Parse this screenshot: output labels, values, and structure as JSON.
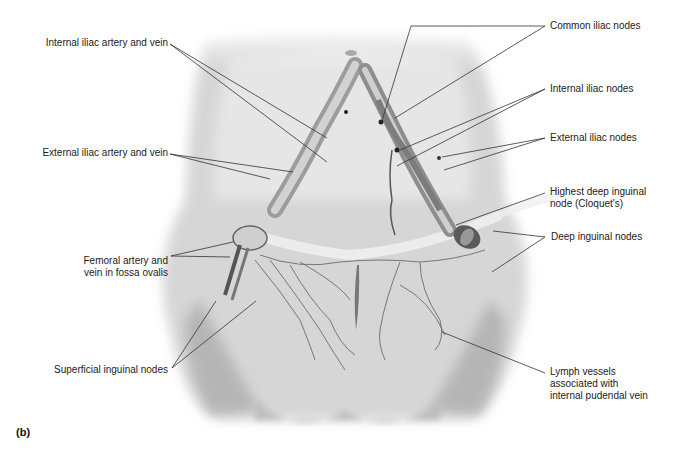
{
  "figure": {
    "panel_label": "(b)"
  },
  "labels_left": [
    {
      "id": "internal-iliac-artery-vein",
      "text": "Internal iliac artery and vein"
    },
    {
      "id": "external-iliac-artery-vein",
      "text": "External iliac artery and vein"
    },
    {
      "id": "femoral-artery-vein",
      "line1": "Femoral artery and",
      "line2": "vein in fossa ovalis"
    },
    {
      "id": "superficial-inguinal-nodes",
      "text": "Superficial inguinal nodes"
    }
  ],
  "labels_right": [
    {
      "id": "common-iliac-nodes",
      "text": "Common iliac nodes"
    },
    {
      "id": "internal-iliac-nodes",
      "text": "Internal iliac nodes"
    },
    {
      "id": "external-iliac-nodes",
      "text": "External iliac nodes"
    },
    {
      "id": "highest-deep-inguinal-node",
      "line1": "Highest deep inguinal",
      "line2": "node (Cloquet's)"
    },
    {
      "id": "deep-inguinal-nodes",
      "text": "Deep inguinal nodes"
    },
    {
      "id": "lymph-vessels-pudendal",
      "line1": "Lymph vessels",
      "line2": "associated with",
      "line3": "internal pudendal vein"
    }
  ]
}
